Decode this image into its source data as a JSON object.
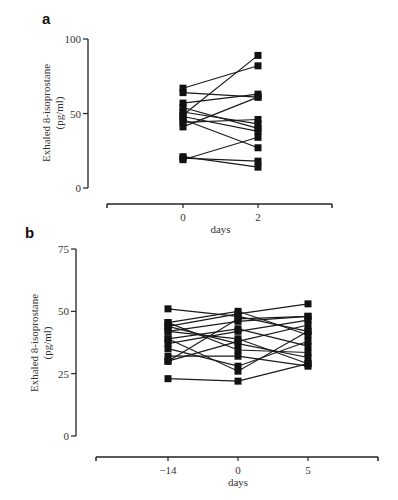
{
  "panels": [
    {
      "label": "a"
    },
    {
      "label": "b"
    }
  ],
  "chart_data": [
    {
      "panel": "a",
      "type": "line",
      "title": "",
      "xlabel": "days",
      "ylabel": "Exhaled 8-isoprostane (pg/ml)",
      "ylabel_lines": [
        "Exhaled 8-isoprostane",
        "(pg/ml)"
      ],
      "x_ticks": [
        "0",
        "2"
      ],
      "y_ticks": [
        0,
        50,
        100
      ],
      "ylim": [
        0,
        100
      ],
      "grid": false,
      "legend": null,
      "marker": "square",
      "series": [
        {
          "name": "subject 1",
          "values": [
            67,
            82
          ]
        },
        {
          "name": "subject 2",
          "values": [
            64,
            61
          ]
        },
        {
          "name": "subject 3",
          "values": [
            57,
            63
          ]
        },
        {
          "name": "subject 4",
          "values": [
            54,
            40
          ]
        },
        {
          "name": "subject 5",
          "values": [
            51,
            43
          ]
        },
        {
          "name": "subject 6",
          "values": [
            49,
            89
          ]
        },
        {
          "name": "subject 7",
          "values": [
            48,
            38
          ]
        },
        {
          "name": "subject 8",
          "values": [
            46,
            27
          ]
        },
        {
          "name": "subject 9",
          "values": [
            41,
            61
          ]
        },
        {
          "name": "subject 10",
          "values": [
            44,
            46
          ]
        },
        {
          "name": "subject 11",
          "values": [
            21,
            14
          ]
        },
        {
          "name": "subject 12",
          "values": [
            19,
            34
          ]
        },
        {
          "name": "subject 13",
          "values": [
            20,
            18
          ]
        }
      ]
    },
    {
      "panel": "b",
      "type": "line",
      "title": "",
      "xlabel": "days",
      "ylabel": "Exhaled 8-isoprostane (pg/ml)",
      "ylabel_lines": [
        "Exhaled 8-isoprostane",
        "(pg/ml)"
      ],
      "x_ticks": [
        "−14",
        "0",
        "5"
      ],
      "y_ticks": [
        0,
        25,
        50,
        75
      ],
      "ylim": [
        0,
        75
      ],
      "grid": false,
      "legend": null,
      "marker": "square",
      "series": [
        {
          "name": "subject 1",
          "values": [
            51,
            48,
            42
          ]
        },
        {
          "name": "subject 2",
          "values": [
            45.5,
            50,
            40.5
          ]
        },
        {
          "name": "subject 3",
          "values": [
            44,
            49,
            53
          ]
        },
        {
          "name": "subject 4",
          "values": [
            42,
            46,
            48
          ]
        },
        {
          "name": "subject 5",
          "values": [
            39,
            43,
            36
          ]
        },
        {
          "name": "subject 6",
          "values": [
            44,
            37,
            31.5
          ]
        },
        {
          "name": "subject 7",
          "values": [
            37,
            42,
            46.5
          ]
        },
        {
          "name": "subject 8",
          "values": [
            45.5,
            34.5,
            33.5
          ]
        },
        {
          "name": "subject 9",
          "values": [
            35,
            28,
            38
          ]
        },
        {
          "name": "subject 10",
          "values": [
            42,
            39,
            29
          ]
        },
        {
          "name": "subject 11",
          "values": [
            32,
            32,
            28
          ]
        },
        {
          "name": "subject 12",
          "values": [
            30,
            38,
            44.5
          ]
        },
        {
          "name": "subject 13",
          "values": [
            39,
            26,
            42
          ]
        },
        {
          "name": "subject 14",
          "values": [
            30,
            47,
            48
          ]
        },
        {
          "name": "subject 15",
          "values": [
            23,
            22,
            29
          ]
        }
      ]
    }
  ],
  "layout": {
    "line_color": "#1a1a1a",
    "marker_color": "#111111",
    "axis_color": "#222222"
  }
}
